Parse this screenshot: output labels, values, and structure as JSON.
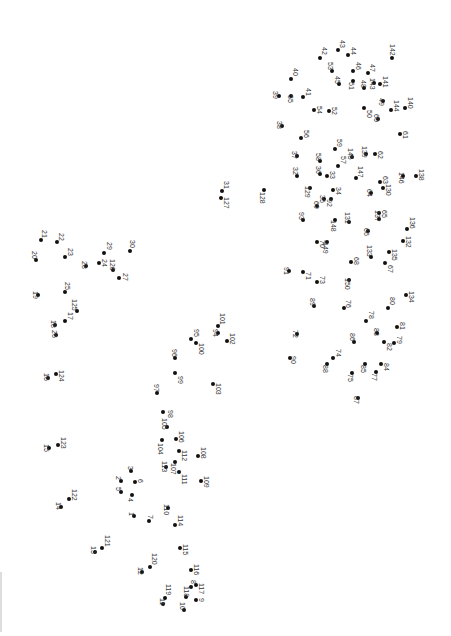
{
  "puzzle": {
    "type": "connect-the-dots",
    "orientation": "rotated-90",
    "dot_color": "#111111",
    "label_color": "#333333",
    "background": "#ffffff"
  },
  "dots": [
    {
      "n": "1",
      "x": 134,
      "y": 516,
      "lx": 128,
      "ly": 512
    },
    {
      "n": "2",
      "x": 121,
      "y": 481,
      "lx": 115,
      "ly": 476
    },
    {
      "n": "3",
      "x": 131,
      "y": 471,
      "lx": 127,
      "ly": 466
    },
    {
      "n": "4",
      "x": 132,
      "y": 495,
      "lx": 127,
      "ly": 498
    },
    {
      "n": "5",
      "x": 121,
      "y": 492,
      "lx": 115,
      "ly": 487
    },
    {
      "n": "6",
      "x": 135,
      "y": 482,
      "lx": 137,
      "ly": 479
    },
    {
      "n": "7",
      "x": 149,
      "y": 521,
      "lx": 147,
      "ly": 515
    },
    {
      "n": "8",
      "x": 191,
      "y": 587,
      "lx": 190,
      "ly": 580
    },
    {
      "n": "9",
      "x": 196,
      "y": 600,
      "lx": 198,
      "ly": 598
    },
    {
      "n": "10",
      "x": 184,
      "y": 610,
      "lx": 179,
      "ly": 602
    },
    {
      "n": "11",
      "x": 163,
      "y": 604,
      "lx": 159,
      "ly": 598
    },
    {
      "n": "12",
      "x": 142,
      "y": 572,
      "lx": 137,
      "ly": 567
    },
    {
      "n": "13",
      "x": 95,
      "y": 552,
      "lx": 90,
      "ly": 546
    },
    {
      "n": "14",
      "x": 61,
      "y": 507,
      "lx": 55,
      "ly": 502
    },
    {
      "n": "15",
      "x": 49,
      "y": 448,
      "lx": 43,
      "ly": 444
    },
    {
      "n": "16",
      "x": 48,
      "y": 378,
      "lx": 43,
      "ly": 373
    },
    {
      "n": "17",
      "x": 65,
      "y": 321,
      "lx": 67,
      "ly": 312
    },
    {
      "n": "18",
      "x": 55,
      "y": 325,
      "lx": 50,
      "ly": 320
    },
    {
      "n": "19",
      "x": 38,
      "y": 295,
      "lx": 32,
      "ly": 291
    },
    {
      "n": "20",
      "x": 36,
      "y": 260,
      "lx": 31,
      "ly": 251
    },
    {
      "n": "21",
      "x": 41,
      "y": 240,
      "lx": 41,
      "ly": 230
    },
    {
      "n": "22",
      "x": 57,
      "y": 242,
      "lx": 58,
      "ly": 233
    },
    {
      "n": "23",
      "x": 65,
      "y": 257,
      "lx": 67,
      "ly": 248
    },
    {
      "n": "24",
      "x": 99,
      "y": 263,
      "lx": 101,
      "ly": 259
    },
    {
      "n": "25",
      "x": 65,
      "y": 292,
      "lx": 64,
      "ly": 282
    },
    {
      "n": "26",
      "x": 56,
      "y": 335,
      "lx": 51,
      "ly": 330
    },
    {
      "n": "27",
      "x": 119,
      "y": 278,
      "lx": 122,
      "ly": 273
    },
    {
      "n": "28",
      "x": 86,
      "y": 266,
      "lx": 81,
      "ly": 261
    },
    {
      "n": "29",
      "x": 104,
      "y": 253,
      "lx": 106,
      "ly": 242
    },
    {
      "n": "30",
      "x": 130,
      "y": 251,
      "lx": 129,
      "ly": 240
    },
    {
      "n": "31",
      "x": 222,
      "y": 191,
      "lx": 223,
      "ly": 181
    },
    {
      "n": "32",
      "x": 297,
      "y": 176,
      "lx": 292,
      "ly": 167
    },
    {
      "n": "33",
      "x": 327,
      "y": 176,
      "lx": 329,
      "ly": 171
    },
    {
      "n": "34",
      "x": 333,
      "y": 190,
      "lx": 335,
      "ly": 187
    },
    {
      "n": "35",
      "x": 324,
      "y": 199,
      "lx": 319,
      "ly": 195
    },
    {
      "n": "36",
      "x": 320,
      "y": 174,
      "lx": 315,
      "ly": 166
    },
    {
      "n": "37",
      "x": 297,
      "y": 156,
      "lx": 291,
      "ly": 151
    },
    {
      "n": "38",
      "x": 282,
      "y": 126,
      "lx": 276,
      "ly": 121
    },
    {
      "n": "39",
      "x": 279,
      "y": 96,
      "lx": 272,
      "ly": 91
    },
    {
      "n": "40",
      "x": 291,
      "y": 79,
      "lx": 292,
      "ly": 68
    },
    {
      "n": "41",
      "x": 303,
      "y": 97,
      "lx": 305,
      "ly": 88
    },
    {
      "n": "42",
      "x": 320,
      "y": 58,
      "lx": 321,
      "ly": 47
    },
    {
      "n": "43",
      "x": 338,
      "y": 50,
      "lx": 339,
      "ly": 40
    },
    {
      "n": "44",
      "x": 348,
      "y": 55,
      "lx": 350,
      "ly": 47
    },
    {
      "n": "45",
      "x": 339,
      "y": 84,
      "lx": 334,
      "ly": 76
    },
    {
      "n": "46",
      "x": 353,
      "y": 71,
      "lx": 355,
      "ly": 62
    },
    {
      "n": "47",
      "x": 368,
      "y": 73,
      "lx": 369,
      "ly": 64
    },
    {
      "n": "48",
      "x": 364,
      "y": 88,
      "lx": 360,
      "ly": 80
    },
    {
      "n": "49",
      "x": 383,
      "y": 101,
      "lx": 378,
      "ly": 98
    },
    {
      "n": "50",
      "x": 364,
      "y": 108,
      "lx": 366,
      "ly": 110
    },
    {
      "n": "51",
      "x": 353,
      "y": 81,
      "lx": 348,
      "ly": 82
    },
    {
      "n": "52",
      "x": 329,
      "y": 111,
      "lx": 331,
      "ly": 107
    },
    {
      "n": "53",
      "x": 332,
      "y": 71,
      "lx": 327,
      "ly": 62
    },
    {
      "n": "54",
      "x": 314,
      "y": 110,
      "lx": 316,
      "ly": 106
    },
    {
      "n": "55",
      "x": 291,
      "y": 96,
      "lx": 287,
      "ly": 95
    },
    {
      "n": "56",
      "x": 301,
      "y": 138,
      "lx": 303,
      "ly": 130
    },
    {
      "n": "57",
      "x": 338,
      "y": 166,
      "lx": 340,
      "ly": 156
    },
    {
      "n": "58",
      "x": 320,
      "y": 161,
      "lx": 315,
      "ly": 153
    },
    {
      "n": "59",
      "x": 335,
      "y": 149,
      "lx": 336,
      "ly": 139
    },
    {
      "n": "60",
      "x": 378,
      "y": 119,
      "lx": 373,
      "ly": 114
    },
    {
      "n": "61",
      "x": 400,
      "y": 134,
      "lx": 402,
      "ly": 131
    },
    {
      "n": "62",
      "x": 375,
      "y": 154,
      "lx": 377,
      "ly": 151
    },
    {
      "n": "63",
      "x": 380,
      "y": 182,
      "lx": 382,
      "ly": 176
    },
    {
      "n": "64",
      "x": 371,
      "y": 193,
      "lx": 366,
      "ly": 189
    },
    {
      "n": "65",
      "x": 379,
      "y": 213,
      "lx": 381,
      "ly": 210
    },
    {
      "n": "66",
      "x": 368,
      "y": 231,
      "lx": 363,
      "ly": 228
    },
    {
      "n": "67",
      "x": 385,
      "y": 263,
      "lx": 387,
      "ly": 265
    },
    {
      "n": "68",
      "x": 351,
      "y": 262,
      "lx": 353,
      "ly": 257
    },
    {
      "n": "69",
      "x": 317,
      "y": 206,
      "lx": 313,
      "ly": 201
    },
    {
      "n": "70",
      "x": 317,
      "y": 242,
      "lx": 319,
      "ly": 240
    },
    {
      "n": "71",
      "x": 303,
      "y": 272,
      "lx": 305,
      "ly": 272
    },
    {
      "n": "72",
      "x": 297,
      "y": 334,
      "lx": 292,
      "ly": 330
    },
    {
      "n": "73",
      "x": 317,
      "y": 282,
      "lx": 319,
      "ly": 276
    },
    {
      "n": "74",
      "x": 333,
      "y": 358,
      "lx": 335,
      "ly": 349
    },
    {
      "n": "75",
      "x": 352,
      "y": 373,
      "lx": 347,
      "ly": 374
    },
    {
      "n": "76",
      "x": 344,
      "y": 308,
      "lx": 345,
      "ly": 300
    },
    {
      "n": "77",
      "x": 376,
      "y": 372,
      "lx": 371,
      "ly": 373
    },
    {
      "n": "78",
      "x": 366,
      "y": 321,
      "lx": 368,
      "ly": 311
    },
    {
      "n": "79",
      "x": 394,
      "y": 343,
      "lx": 396,
      "ly": 336
    },
    {
      "n": "80",
      "x": 388,
      "y": 308,
      "lx": 389,
      "ly": 297
    },
    {
      "n": "81",
      "x": 397,
      "y": 327,
      "lx": 399,
      "ly": 322
    },
    {
      "n": "82",
      "x": 384,
      "y": 342,
      "lx": 386,
      "ly": 343
    },
    {
      "n": "83",
      "x": 377,
      "y": 333,
      "lx": 373,
      "ly": 328
    },
    {
      "n": "84",
      "x": 381,
      "y": 364,
      "lx": 383,
      "ly": 363
    },
    {
      "n": "85",
      "x": 365,
      "y": 364,
      "lx": 360,
      "ly": 365
    },
    {
      "n": "86",
      "x": 354,
      "y": 342,
      "lx": 349,
      "ly": 333
    },
    {
      "n": "87",
      "x": 358,
      "y": 398,
      "lx": 353,
      "ly": 396
    },
    {
      "n": "88",
      "x": 327,
      "y": 364,
      "lx": 322,
      "ly": 365
    },
    {
      "n": "89",
      "x": 314,
      "y": 306,
      "lx": 309,
      "ly": 298
    },
    {
      "n": "90",
      "x": 290,
      "y": 358,
      "lx": 290,
      "ly": 356
    },
    {
      "n": "91",
      "x": 289,
      "y": 271,
      "lx": 283,
      "ly": 267
    },
    {
      "n": "92",
      "x": 331,
      "y": 199,
      "lx": 326,
      "ly": 199
    },
    {
      "n": "93",
      "x": 303,
      "y": 220,
      "lx": 298,
      "ly": 212
    },
    {
      "n": "94",
      "x": 218,
      "y": 333,
      "lx": 212,
      "ly": 329
    },
    {
      "n": "95",
      "x": 191,
      "y": 339,
      "lx": 193,
      "ly": 329
    },
    {
      "n": "96",
      "x": 175,
      "y": 358,
      "lx": 171,
      "ly": 349
    },
    {
      "n": "97",
      "x": 157,
      "y": 393,
      "lx": 153,
      "ly": 384
    },
    {
      "n": "98",
      "x": 163,
      "y": 412,
      "lx": 167,
      "ly": 410
    },
    {
      "n": "99",
      "x": 175,
      "y": 373,
      "lx": 177,
      "ly": 376
    },
    {
      "n": "100",
      "x": 196,
      "y": 343,
      "lx": 198,
      "ly": 343
    },
    {
      "n": "101",
      "x": 218,
      "y": 326,
      "lx": 219,
      "ly": 313
    },
    {
      "n": "102",
      "x": 227,
      "y": 341,
      "lx": 229,
      "ly": 333
    },
    {
      "n": "103",
      "x": 213,
      "y": 384,
      "lx": 215,
      "ly": 383
    },
    {
      "n": "104",
      "x": 162,
      "y": 440,
      "lx": 157,
      "ly": 443
    },
    {
      "n": "105",
      "x": 167,
      "y": 427,
      "lx": 161,
      "ly": 418
    },
    {
      "n": "106",
      "x": 176,
      "y": 439,
      "lx": 178,
      "ly": 431
    },
    {
      "n": "107",
      "x": 175,
      "y": 462,
      "lx": 170,
      "ly": 463
    },
    {
      "n": "108",
      "x": 198,
      "y": 456,
      "lx": 200,
      "ly": 447
    },
    {
      "n": "109",
      "x": 201,
      "y": 481,
      "lx": 203,
      "ly": 476
    },
    {
      "n": "110",
      "x": 168,
      "y": 508,
      "lx": 163,
      "ly": 504
    },
    {
      "n": "111",
      "x": 179,
      "y": 472,
      "lx": 181,
      "ly": 474
    },
    {
      "n": "112",
      "x": 179,
      "y": 451,
      "lx": 181,
      "ly": 450
    },
    {
      "n": "113",
      "x": 166,
      "y": 467,
      "lx": 161,
      "ly": 461
    },
    {
      "n": "114",
      "x": 175,
      "y": 525,
      "lx": 177,
      "ly": 515
    },
    {
      "n": "115",
      "x": 180,
      "y": 548,
      "lx": 182,
      "ly": 544
    },
    {
      "n": "116",
      "x": 191,
      "y": 570,
      "lx": 193,
      "ly": 564
    },
    {
      "n": "117",
      "x": 196,
      "y": 585,
      "lx": 198,
      "ly": 583
    },
    {
      "n": "118",
      "x": 186,
      "y": 597,
      "lx": 183,
      "ly": 586
    },
    {
      "n": "119",
      "x": 165,
      "y": 598,
      "lx": 165,
      "ly": 584
    },
    {
      "n": "120",
      "x": 150,
      "y": 567,
      "lx": 151,
      "ly": 553
    },
    {
      "n": "121",
      "x": 102,
      "y": 548,
      "lx": 104,
      "ly": 535
    },
    {
      "n": "122",
      "x": 69,
      "y": 499,
      "lx": 71,
      "ly": 489
    },
    {
      "n": "123",
      "x": 58,
      "y": 445,
      "lx": 60,
      "ly": 437
    },
    {
      "n": "124",
      "x": 56,
      "y": 374,
      "lx": 58,
      "ly": 370
    },
    {
      "n": "125",
      "x": 77,
      "y": 311,
      "lx": 71,
      "ly": 299
    },
    {
      "n": "126",
      "x": 113,
      "y": 270,
      "lx": 109,
      "ly": 259
    },
    {
      "n": "127",
      "x": 221,
      "y": 198,
      "lx": 223,
      "ly": 197
    },
    {
      "n": "128",
      "x": 264,
      "y": 190,
      "lx": 259,
      "ly": 192
    },
    {
      "n": "129",
      "x": 310,
      "y": 188,
      "lx": 304,
      "ly": 186
    },
    {
      "n": "130",
      "x": 383,
      "y": 188,
      "lx": 385,
      "ly": 184
    },
    {
      "n": "131",
      "x": 349,
      "y": 222,
      "lx": 344,
      "ly": 212
    },
    {
      "n": "132",
      "x": 403,
      "y": 241,
      "lx": 405,
      "ly": 236
    },
    {
      "n": "133",
      "x": 371,
      "y": 257,
      "lx": 366,
      "ly": 245
    },
    {
      "n": "134",
      "x": 406,
      "y": 295,
      "lx": 408,
      "ly": 291
    },
    {
      "n": "135",
      "x": 389,
      "y": 252,
      "lx": 391,
      "ly": 249
    },
    {
      "n": "136",
      "x": 407,
      "y": 229,
      "lx": 409,
      "ly": 217
    },
    {
      "n": "137",
      "x": 379,
      "y": 219,
      "lx": 374,
      "ly": 210
    },
    {
      "n": "138",
      "x": 416,
      "y": 176,
      "lx": 418,
      "ly": 169
    },
    {
      "n": "139",
      "x": 366,
      "y": 154,
      "lx": 361,
      "ly": 146
    },
    {
      "n": "140",
      "x": 405,
      "y": 108,
      "lx": 407,
      "ly": 97
    },
    {
      "n": "141",
      "x": 380,
      "y": 84,
      "lx": 382,
      "ly": 76
    },
    {
      "n": "142",
      "x": 392,
      "y": 58,
      "lx": 389,
      "ly": 44
    },
    {
      "n": "143",
      "x": 374,
      "y": 83,
      "lx": 369,
      "ly": 78
    },
    {
      "n": "144",
      "x": 391,
      "y": 110,
      "lx": 393,
      "ly": 100
    },
    {
      "n": "145",
      "x": 352,
      "y": 157,
      "lx": 347,
      "ly": 148
    },
    {
      "n": "146",
      "x": 403,
      "y": 176,
      "lx": 398,
      "ly": 172
    },
    {
      "n": "147",
      "x": 356,
      "y": 178,
      "lx": 357,
      "ly": 166
    },
    {
      "n": "148",
      "x": 335,
      "y": 220,
      "lx": 330,
      "ly": 220
    },
    {
      "n": "149",
      "x": 327,
      "y": 242,
      "lx": 322,
      "ly": 242
    },
    {
      "n": "150",
      "x": 349,
      "y": 280,
      "lx": 344,
      "ly": 278
    }
  ]
}
